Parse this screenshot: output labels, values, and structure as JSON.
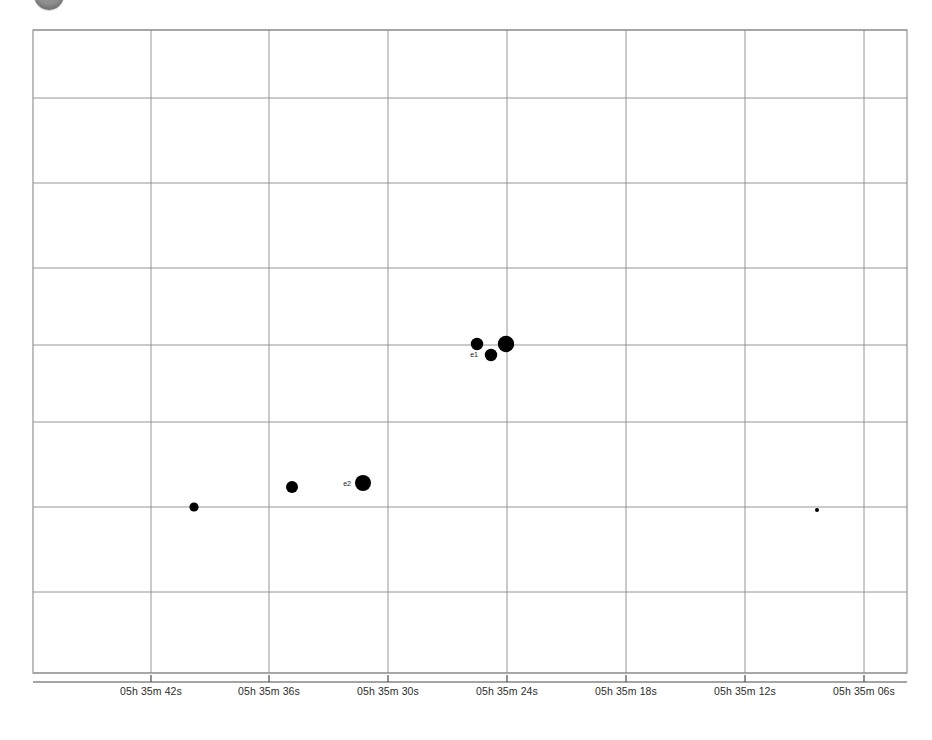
{
  "view": {
    "background_color": "#ffffff",
    "grid_color": "#8a8a8a",
    "axis_color": "#4a4a4a",
    "marker_color": "#000000",
    "top_marker_color": "#8d8d8d",
    "top_marker_name": "field-indicator-disc"
  },
  "chart_data": {
    "type": "scatter",
    "title": "",
    "subtitle": "",
    "xlabel": "",
    "ylabel": "",
    "grid": true,
    "legend": "none",
    "xlim": [
      672.0,
      0.0
    ],
    "ylim": [
      0.0,
      643.0
    ],
    "x_axis": {
      "unit": "right ascension (hours minutes seconds)",
      "direction": "decreasing-right",
      "tick_labels": [
        "05h 35m 42s",
        "05h 35m 36s",
        "05h 35m 30s",
        "05h 35m 24s",
        "05h 35m 18s",
        "05h 35m 12s",
        "05h 35m 06s"
      ],
      "tick_pixel_x": [
        151,
        269,
        388,
        507,
        626,
        745,
        864
      ]
    },
    "y_axis": {
      "unit": "declination",
      "tick_labels": [],
      "gridline_pixel_y": [
        30,
        98,
        183,
        268,
        345,
        422,
        507,
        592,
        673
      ]
    },
    "plot_area": {
      "left": 33,
      "top": 30,
      "right": 907,
      "bottom": 673
    },
    "points": [
      {
        "id": "p1",
        "label": "",
        "px": 194,
        "py": 507,
        "radius": 4.6
      },
      {
        "id": "p2",
        "label": "",
        "px": 292,
        "py": 487,
        "radius": 6.0
      },
      {
        "id": "p3",
        "label": "e2",
        "px": 363,
        "py": 483,
        "radius": 8.0
      },
      {
        "id": "p4",
        "label": "",
        "px": 477,
        "py": 344,
        "radius": 6.2
      },
      {
        "id": "p5",
        "label": "e1",
        "px": 491,
        "py": 355,
        "radius": 6.2
      },
      {
        "id": "p6",
        "label": "",
        "px": 506,
        "py": 344,
        "radius": 8.2
      },
      {
        "id": "p7",
        "label": "",
        "px": 817,
        "py": 510,
        "radius": 2.0
      }
    ],
    "labels": [
      {
        "text": "e1",
        "px": 478,
        "py": 357
      },
      {
        "text": "e2",
        "px": 351,
        "py": 486
      }
    ]
  }
}
